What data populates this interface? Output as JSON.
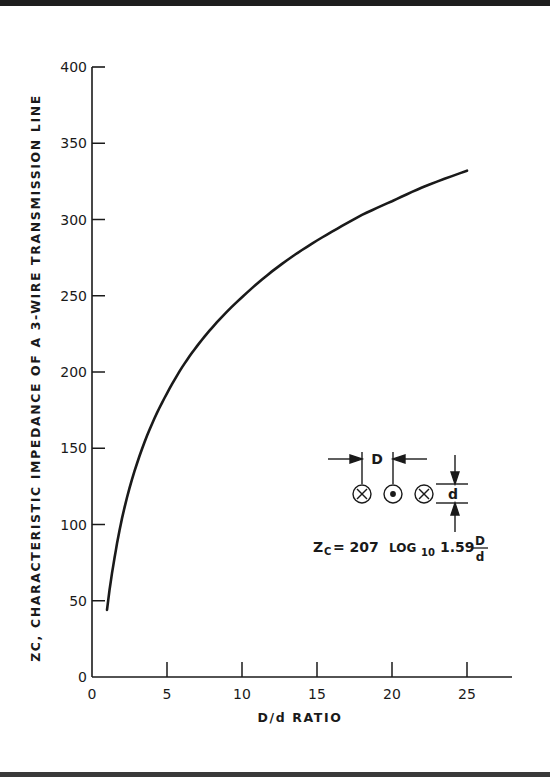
{
  "chart_data": {
    "type": "line",
    "title": "",
    "xlabel": "D/d RATIO",
    "ylabel": "ZC, CHARACTERISTIC IMPEDANCE OF A 3-WIRE TRANSMISSION LINE",
    "xlim": [
      0,
      28
    ],
    "ylim": [
      0,
      400
    ],
    "x_ticks": [
      0,
      5,
      10,
      15,
      20,
      25
    ],
    "y_ticks": [
      0,
      50,
      100,
      150,
      200,
      250,
      300,
      350,
      400
    ],
    "grid": false,
    "legend": null,
    "series": [
      {
        "name": "Zc",
        "x": [
          1,
          1.5,
          2,
          3,
          4,
          5,
          6,
          7,
          8,
          10,
          12,
          14,
          16,
          18,
          20,
          22,
          25
        ],
        "values": [
          44,
          78,
          104,
          140,
          166,
          186,
          203,
          217,
          229,
          249,
          266,
          280,
          292,
          303,
          312,
          321,
          332
        ]
      }
    ],
    "annotations": {
      "diagram_D_label": "D",
      "diagram_d_label": "d",
      "formula": "ZC = 207 LOG10 1.59 D/d"
    }
  },
  "labels": {
    "y_title": "ZC, CHARACTERISTIC IMPEDANCE OF A 3-WIRE TRANSMISSION LINE",
    "x_title": "D/d RATIO",
    "x_ticks": [
      "0",
      "5",
      "10",
      "15",
      "20",
      "25"
    ],
    "y_ticks": [
      "0",
      "50",
      "100",
      "150",
      "200",
      "250",
      "300",
      "350",
      "400"
    ],
    "diagram_D": "D",
    "diagram_d": "d",
    "formula_lhs": "Z",
    "formula_sub_c": "C",
    "formula_eq": "= 207",
    "formula_log": "LOG",
    "formula_log_base": "10",
    "formula_coef": "1.59",
    "formula_num": "D",
    "formula_den": "d"
  },
  "colors": {
    "ink": "#1a1a1a",
    "paper": "#ffffff",
    "frame": "#1e1e1e"
  }
}
